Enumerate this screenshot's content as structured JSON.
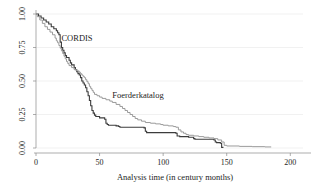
{
  "chart_data": {
    "type": "line",
    "subtype": "kaplan-meier-step",
    "title": "",
    "xlabel": "Analysis time (in century months)",
    "ylabel": "",
    "xlim": [
      0,
      210
    ],
    "ylim": [
      0,
      1.0
    ],
    "xticks": [
      0,
      50,
      100,
      150,
      200
    ],
    "xtick_labels": [
      "0",
      "50",
      "100",
      "150",
      "200"
    ],
    "yticks": [
      0.0,
      0.25,
      0.5,
      0.75,
      1.0
    ],
    "ytick_labels": [
      "0.00",
      "0.25",
      "0.50",
      "0.75",
      "1.00"
    ],
    "grid": "horizontal",
    "grid_color": "#e2e2e2",
    "legend_position": "inline-annotation",
    "series": [
      {
        "name": "CORDIS",
        "color": "#3c3c3c",
        "width": 1.1,
        "annotation": {
          "label": "CORDIS",
          "x": 20,
          "y": 0.8
        },
        "points": [
          [
            0,
            1.0
          ],
          [
            2,
            0.985
          ],
          [
            4,
            0.97
          ],
          [
            6,
            0.955
          ],
          [
            8,
            0.94
          ],
          [
            10,
            0.925
          ],
          [
            12,
            0.905
          ],
          [
            14,
            0.89
          ],
          [
            16,
            0.875
          ],
          [
            17,
            0.86
          ],
          [
            18,
            0.845
          ],
          [
            19,
            0.79
          ],
          [
            20,
            0.75
          ],
          [
            21,
            0.73
          ],
          [
            22,
            0.71
          ],
          [
            23,
            0.69
          ],
          [
            24,
            0.675
          ],
          [
            26,
            0.655
          ],
          [
            27,
            0.635
          ],
          [
            28,
            0.62
          ],
          [
            30,
            0.6
          ],
          [
            31,
            0.585
          ],
          [
            32,
            0.57
          ],
          [
            33,
            0.555
          ],
          [
            34,
            0.545
          ],
          [
            35,
            0.525
          ],
          [
            36,
            0.5
          ],
          [
            37,
            0.485
          ],
          [
            38,
            0.47
          ],
          [
            39,
            0.45
          ],
          [
            40,
            0.42
          ],
          [
            41,
            0.39
          ],
          [
            42,
            0.355
          ],
          [
            43,
            0.315
          ],
          [
            44,
            0.28
          ],
          [
            45,
            0.26
          ],
          [
            46,
            0.245
          ],
          [
            47,
            0.235
          ],
          [
            50,
            0.225
          ],
          [
            54,
            0.215
          ],
          [
            55,
            0.185
          ],
          [
            56,
            0.175
          ],
          [
            57,
            0.17
          ],
          [
            63,
            0.165
          ],
          [
            65,
            0.16
          ],
          [
            66,
            0.155
          ],
          [
            85,
            0.15
          ],
          [
            86,
            0.125
          ],
          [
            87,
            0.115
          ],
          [
            110,
            0.11
          ],
          [
            111,
            0.09
          ],
          [
            113,
            0.085
          ],
          [
            120,
            0.08
          ],
          [
            124,
            0.07
          ],
          [
            125,
            0.065
          ],
          [
            140,
            0.06
          ],
          [
            141,
            0.045
          ],
          [
            142,
            0.04
          ],
          [
            145,
            0.035
          ],
          [
            146,
            0.005
          ],
          [
            147,
            0.0
          ]
        ]
      },
      {
        "name": "Foerderkatalog",
        "color": "#9a9a9a",
        "width": 1.0,
        "annotation": {
          "label": "Foerderkatalog",
          "x": 60,
          "y": 0.375
        },
        "points": [
          [
            0,
            1.0
          ],
          [
            1,
            0.98
          ],
          [
            3,
            0.955
          ],
          [
            5,
            0.93
          ],
          [
            7,
            0.905
          ],
          [
            9,
            0.885
          ],
          [
            11,
            0.865
          ],
          [
            13,
            0.845
          ],
          [
            15,
            0.82
          ],
          [
            16,
            0.8
          ],
          [
            17,
            0.785
          ],
          [
            18,
            0.765
          ],
          [
            19,
            0.745
          ],
          [
            20,
            0.725
          ],
          [
            21,
            0.705
          ],
          [
            22,
            0.685
          ],
          [
            23,
            0.665
          ],
          [
            24,
            0.645
          ],
          [
            25,
            0.63
          ],
          [
            26,
            0.615
          ],
          [
            28,
            0.6
          ],
          [
            30,
            0.585
          ],
          [
            32,
            0.575
          ],
          [
            34,
            0.565
          ],
          [
            35,
            0.555
          ],
          [
            36,
            0.545
          ],
          [
            37,
            0.535
          ],
          [
            38,
            0.525
          ],
          [
            39,
            0.51
          ],
          [
            40,
            0.495
          ],
          [
            41,
            0.48
          ],
          [
            42,
            0.46
          ],
          [
            43,
            0.445
          ],
          [
            44,
            0.43
          ],
          [
            45,
            0.415
          ],
          [
            46,
            0.4
          ],
          [
            48,
            0.39
          ],
          [
            50,
            0.38
          ],
          [
            52,
            0.37
          ],
          [
            55,
            0.36
          ],
          [
            58,
            0.35
          ],
          [
            60,
            0.34
          ],
          [
            63,
            0.325
          ],
          [
            66,
            0.31
          ],
          [
            68,
            0.295
          ],
          [
            70,
            0.28
          ],
          [
            72,
            0.265
          ],
          [
            74,
            0.25
          ],
          [
            76,
            0.235
          ],
          [
            78,
            0.22
          ],
          [
            80,
            0.21
          ],
          [
            83,
            0.2
          ],
          [
            86,
            0.19
          ],
          [
            90,
            0.185
          ],
          [
            94,
            0.18
          ],
          [
            98,
            0.175
          ],
          [
            100,
            0.17
          ],
          [
            104,
            0.165
          ],
          [
            108,
            0.16
          ],
          [
            110,
            0.155
          ],
          [
            112,
            0.135
          ],
          [
            114,
            0.12
          ],
          [
            116,
            0.11
          ],
          [
            118,
            0.1
          ],
          [
            120,
            0.095
          ],
          [
            124,
            0.09
          ],
          [
            128,
            0.085
          ],
          [
            132,
            0.08
          ],
          [
            136,
            0.075
          ],
          [
            140,
            0.07
          ],
          [
            143,
            0.06
          ],
          [
            146,
            0.045
          ],
          [
            148,
            0.02
          ],
          [
            150,
            0.015
          ],
          [
            160,
            0.012
          ],
          [
            170,
            0.01
          ],
          [
            180,
            0.008
          ],
          [
            185,
            0.008
          ]
        ]
      }
    ]
  },
  "axes": {
    "x_axis_name": "analysis-time-axis",
    "y_axis_name": "survival-probability-axis"
  }
}
